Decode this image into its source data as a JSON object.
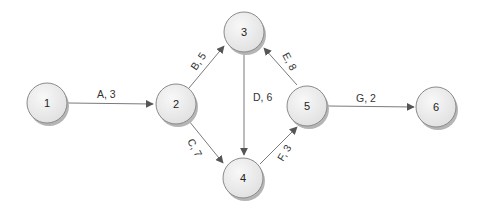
{
  "diagram": {
    "type": "activity-on-arrow network",
    "nodes": [
      {
        "id": "1",
        "label": "1",
        "x": 47,
        "y": 103
      },
      {
        "id": "2",
        "label": "2",
        "x": 176,
        "y": 104
      },
      {
        "id": "3",
        "label": "3",
        "x": 244,
        "y": 32
      },
      {
        "id": "4",
        "label": "4",
        "x": 243,
        "y": 178
      },
      {
        "id": "5",
        "label": "5",
        "x": 307,
        "y": 106
      },
      {
        "id": "6",
        "label": "6",
        "x": 436,
        "y": 107
      }
    ],
    "edges": [
      {
        "from": "1",
        "to": "2",
        "label": "A, 3"
      },
      {
        "from": "2",
        "to": "3",
        "label": "B, 5"
      },
      {
        "from": "2",
        "to": "4",
        "label": "C, 7"
      },
      {
        "from": "3",
        "to": "4",
        "label": "D, 6"
      },
      {
        "from": "5",
        "to": "3",
        "label": "E, 8"
      },
      {
        "from": "4",
        "to": "5",
        "label": "F, 3"
      },
      {
        "from": "5",
        "to": "6",
        "label": "G, 2"
      }
    ],
    "colors": {
      "node_fill": "#ececec",
      "node_stroke": "#8a8a8a",
      "node_shadow": "#b5b5b5",
      "edge": "#7a7a7a",
      "arrowhead": "#555555"
    }
  }
}
